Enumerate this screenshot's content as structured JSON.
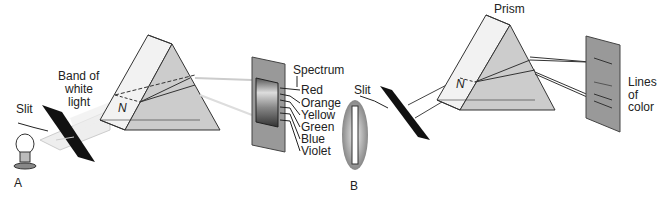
{
  "panel_a": {
    "label": "A",
    "slit_label": "Slit",
    "band_label_1": "Band of",
    "band_label_2": "white",
    "band_label_3": "light",
    "normal_label": "N",
    "spectrum_label": "Spectrum",
    "colors": [
      "Red",
      "Orange",
      "Yellow",
      "Green",
      "Blue",
      "Violet"
    ]
  },
  "panel_b": {
    "label": "B",
    "slit_label": "Slit",
    "prism_label": "Prism",
    "normal_label": "N",
    "lines_label_1": "Lines",
    "lines_label_2": "of",
    "lines_label_3": "color"
  }
}
